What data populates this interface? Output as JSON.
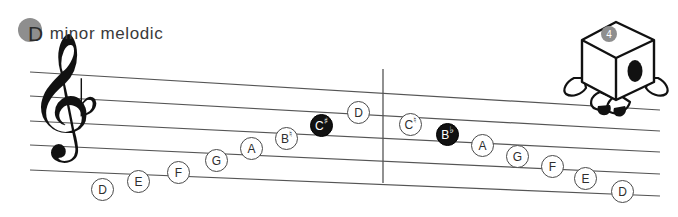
{
  "title": {
    "badge_letter": "D",
    "text": "minor melodic",
    "badge_color": "#8e8e8e"
  },
  "score": {
    "clef": "treble-clef",
    "clef_glyph": "𝄞",
    "key_signature": {
      "accidental": "flat",
      "glyph": "♭",
      "count": 1
    },
    "barline_present": true,
    "staff_lines": 5,
    "staff_color": "#555555"
  },
  "notes": [
    {
      "id": "n1",
      "letter": "D",
      "accidental": "",
      "style": "open",
      "x": 91,
      "y": 178
    },
    {
      "id": "n2",
      "letter": "E",
      "accidental": "",
      "style": "open",
      "x": 127,
      "y": 170
    },
    {
      "id": "n3",
      "letter": "F",
      "accidental": "",
      "style": "open",
      "x": 167,
      "y": 161
    },
    {
      "id": "n4",
      "letter": "G",
      "accidental": "",
      "style": "open",
      "x": 205,
      "y": 149
    },
    {
      "id": "n5",
      "letter": "A",
      "accidental": "",
      "style": "open",
      "x": 240,
      "y": 137
    },
    {
      "id": "n6",
      "letter": "B",
      "accidental": "♮",
      "style": "open",
      "x": 275,
      "y": 127
    },
    {
      "id": "n7",
      "letter": "C",
      "accidental": "♯",
      "style": "filled",
      "x": 310,
      "y": 114
    },
    {
      "id": "n8",
      "letter": "D",
      "accidental": "",
      "style": "open",
      "x": 347,
      "y": 101
    },
    {
      "id": "n9",
      "letter": "C",
      "accidental": "♮",
      "style": "open",
      "x": 399,
      "y": 113
    },
    {
      "id": "n10",
      "letter": "B",
      "accidental": "♭",
      "style": "filled",
      "x": 436,
      "y": 123
    },
    {
      "id": "n11",
      "letter": "A",
      "accidental": "",
      "style": "open",
      "x": 471,
      "y": 134
    },
    {
      "id": "n12",
      "letter": "G",
      "accidental": "",
      "style": "open",
      "x": 506,
      "y": 145
    },
    {
      "id": "n13",
      "letter": "F",
      "accidental": "",
      "style": "open",
      "x": 541,
      "y": 155
    },
    {
      "id": "n14",
      "letter": "E",
      "accidental": "",
      "style": "open",
      "x": 574,
      "y": 167
    },
    {
      "id": "n15",
      "letter": "D",
      "accidental": "",
      "style": "open",
      "x": 611,
      "y": 180
    }
  ],
  "mascot": {
    "name": "cube-character",
    "badge_number": "4",
    "badge_color": "#8e8e8e"
  }
}
